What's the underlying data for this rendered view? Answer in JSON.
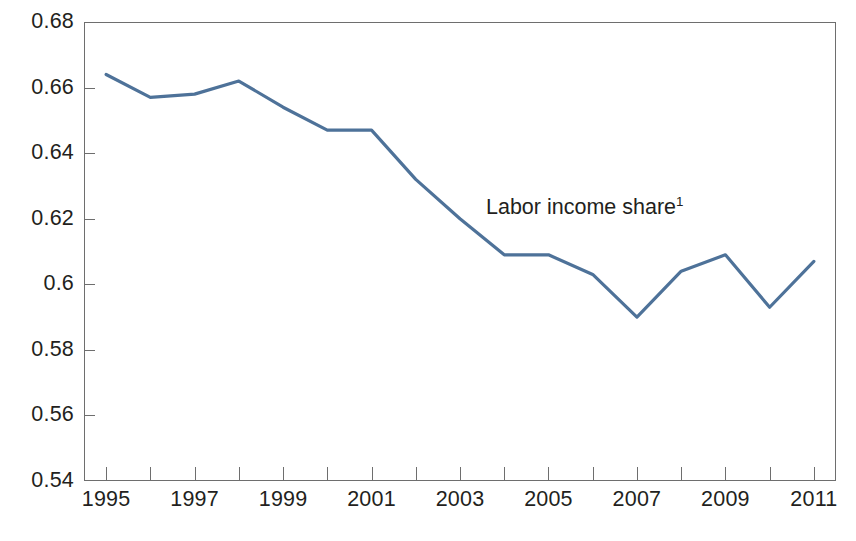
{
  "chart_data": {
    "type": "line",
    "title": "",
    "subtitle": "",
    "xlabel": "",
    "ylabel": "",
    "grid": false,
    "legend_position": "inline-annotation",
    "xlim": [
      1994.5,
      2011.5
    ],
    "ylim": [
      0.54,
      0.68
    ],
    "x": [
      1995,
      1996,
      1997,
      1998,
      1999,
      2000,
      2001,
      2002,
      2003,
      2004,
      2005,
      2006,
      2007,
      2008,
      2009,
      2010,
      2011
    ],
    "categories": [
      "1995",
      "1996",
      "1997",
      "1998",
      "1999",
      "2000",
      "2001",
      "2002",
      "2003",
      "2004",
      "2005",
      "2006",
      "2007",
      "2008",
      "2009",
      "2010",
      "2011"
    ],
    "series": [
      {
        "name": "Labor income share",
        "annotation": "Labor income share",
        "annotation_footnote": "1",
        "color": "#4e7299",
        "line_width": 3.2,
        "values": [
          0.664,
          0.657,
          0.658,
          0.662,
          0.654,
          0.647,
          0.647,
          0.632,
          0.62,
          0.609,
          0.609,
          0.603,
          0.59,
          0.604,
          0.609,
          0.593,
          0.607
        ]
      }
    ],
    "y_ticks": [
      0.54,
      0.56,
      0.58,
      0.6,
      0.62,
      0.64,
      0.66,
      0.68
    ],
    "y_tick_labels": [
      "0.54",
      "0.56",
      "0.58",
      "0.6",
      "0.62",
      "0.64",
      "0.66",
      "0.68"
    ],
    "x_ticks": [
      1995,
      1996,
      1997,
      1998,
      1999,
      2000,
      2001,
      2002,
      2003,
      2004,
      2005,
      2006,
      2007,
      2008,
      2009,
      2010,
      2011
    ],
    "x_tick_labels_shown": [
      "1995",
      "1997",
      "1999",
      "2001",
      "2003",
      "2005",
      "2007",
      "2009",
      "2011"
    ],
    "axis_color": "#6e6e6e",
    "background_color": "#ffffff",
    "text_color": "#231f20"
  }
}
